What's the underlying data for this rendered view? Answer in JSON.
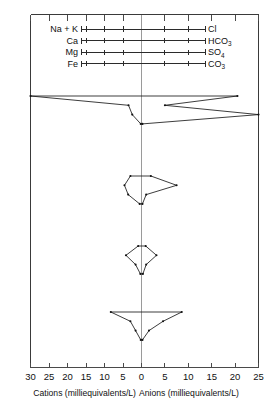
{
  "chart_data": {
    "type": "line",
    "chart_kind": "stiff-diagram",
    "title": "",
    "subtitle": "",
    "xlabel_left": "Cations (milliequivalents/L)",
    "xlabel_right": "Anions (milliequivalents/L)",
    "ylabel": "",
    "grid": false,
    "legend_position": "top-inside",
    "axis": {
      "left_label": "Cations (milliequivalents/L)",
      "right_label": "Anions (milliequivalents/L)",
      "center_value": 0,
      "left_max": 30,
      "right_max": 25,
      "tick_step": 5,
      "left_ticks": [
        30,
        25,
        20,
        15,
        10,
        5,
        0
      ],
      "right_ticks": [
        0,
        5,
        10,
        15,
        20,
        25
      ],
      "tick_labels_left": [
        "30",
        "25",
        "20",
        "15",
        "10",
        "5",
        "0"
      ],
      "tick_labels_right": [
        "0",
        "5",
        "10",
        "15",
        "20",
        "25"
      ],
      "units": "milliequivalents/L"
    },
    "legend": {
      "rows": [
        {
          "cation": "Na + K",
          "anion": "Cl",
          "anion_sub": ""
        },
        {
          "cation": "Ca",
          "anion": "HCO",
          "anion_sub": "3"
        },
        {
          "cation": "Mg",
          "anion": "SO",
          "anion_sub": "4"
        },
        {
          "cation": "Fe",
          "anion": "CO",
          "anion_sub": "3"
        }
      ]
    },
    "ion_rows": [
      "Na + K / Cl",
      "Ca / HCO3",
      "Mg / SO4",
      "Fe / CO3"
    ],
    "series": [
      {
        "name": "Sample 1",
        "cations": {
          "Na_K": 30.0,
          "Ca": 3.5,
          "Mg": 2.5,
          "Fe": 0.2
        },
        "anions": {
          "Cl": 20.5,
          "HCO3": 5.0,
          "SO4": 25.0,
          "CO3": 0.2
        }
      },
      {
        "name": "Sample 2",
        "cations": {
          "Na_K": 3.0,
          "Ca": 4.6,
          "Mg": 3.6,
          "Fe": 0.5
        },
        "anions": {
          "Cl": 2.0,
          "HCO3": 7.5,
          "SO4": 1.0,
          "CO3": 0.2
        }
      },
      {
        "name": "Sample 3",
        "cations": {
          "Na_K": 0.9,
          "Ca": 4.2,
          "Mg": 1.6,
          "Fe": 0.3
        },
        "anions": {
          "Cl": 0.9,
          "HCO3": 3.2,
          "SO4": 1.0,
          "CO3": 0.3
        }
      },
      {
        "name": "Sample 4",
        "cations": {
          "Na_K": 8.3,
          "Ca": 3.0,
          "Mg": 1.6,
          "Fe": 0.2
        },
        "anions": {
          "Cl": 8.6,
          "HCO3": 4.6,
          "SO4": 1.6,
          "CO3": 0.2
        }
      }
    ],
    "series_baseline_y": [
      96,
      176,
      246,
      312
    ],
    "row_spacing_px": 9.3
  }
}
